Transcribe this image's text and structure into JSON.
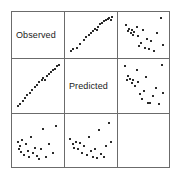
{
  "figure": {
    "type": "scatterplot-matrix",
    "width": 180,
    "height": 180,
    "background": "#ffffff",
    "frame_color": "#6b6b6b",
    "point_color": "#2b2b2b",
    "label_color": "#1a1a1a"
  },
  "variables": [
    {
      "key": "observed",
      "label": "Observed"
    },
    {
      "key": "predicted",
      "label": "Predicted"
    },
    {
      "key": "std_residuals",
      "label": "Std Residuals"
    }
  ],
  "chart_data": {
    "type": "scatter",
    "title": "",
    "xlabel": "",
    "ylabel": "",
    "grid": false,
    "legend": "none",
    "matrix": {
      "rows": [
        "Observed",
        "Predicted",
        "Std Residuals"
      ],
      "cols": [
        "Observed",
        "Predicted",
        "Std Residuals"
      ],
      "diagonal": "variable-label",
      "axis_ranges": {
        "x": [
          0,
          1
        ],
        "y": [
          0,
          1
        ]
      },
      "note": "Off-diagonal panels plot column variable on x and row variable on y; coordinates below are normalized 0-1 within each panel, y measured upward."
    },
    "panels": [
      {
        "row": 0,
        "col": 0,
        "kind": "diagonal",
        "label": "Observed",
        "points": []
      },
      {
        "row": 0,
        "col": 1,
        "kind": "scatter",
        "x_var": "Predicted",
        "y_var": "Observed",
        "relationship": "strong positive linear",
        "points": [
          [
            0.05,
            0.07
          ],
          [
            0.1,
            0.12
          ],
          [
            0.18,
            0.17
          ],
          [
            0.26,
            0.27
          ],
          [
            0.33,
            0.36
          ],
          [
            0.39,
            0.44
          ],
          [
            0.45,
            0.5
          ],
          [
            0.5,
            0.55
          ],
          [
            0.55,
            0.6
          ],
          [
            0.58,
            0.66
          ],
          [
            0.63,
            0.62
          ],
          [
            0.66,
            0.72
          ],
          [
            0.71,
            0.78
          ],
          [
            0.76,
            0.82
          ],
          [
            0.8,
            0.86
          ],
          [
            0.84,
            0.9
          ],
          [
            0.88,
            0.93
          ],
          [
            0.92,
            0.95
          ],
          [
            0.95,
            0.9
          ],
          [
            0.97,
            0.97
          ]
        ]
      },
      {
        "row": 0,
        "col": 2,
        "kind": "scatter",
        "x_var": "Std Residuals",
        "y_var": "Observed",
        "relationship": "no clear pattern",
        "points": [
          [
            0.09,
            0.76
          ],
          [
            0.13,
            0.6
          ],
          [
            0.16,
            0.66
          ],
          [
            0.2,
            0.55
          ],
          [
            0.22,
            0.63
          ],
          [
            0.24,
            0.5
          ],
          [
            0.28,
            0.58
          ],
          [
            0.33,
            0.7
          ],
          [
            0.36,
            0.47
          ],
          [
            0.38,
            0.2
          ],
          [
            0.44,
            0.3
          ],
          [
            0.48,
            0.62
          ],
          [
            0.52,
            0.15
          ],
          [
            0.56,
            0.4
          ],
          [
            0.61,
            0.12
          ],
          [
            0.66,
            0.35
          ],
          [
            0.72,
            0.08
          ],
          [
            0.79,
            0.55
          ],
          [
            0.88,
            0.94
          ],
          [
            0.93,
            0.24
          ]
        ]
      },
      {
        "row": 1,
        "col": 0,
        "kind": "scatter",
        "x_var": "Observed",
        "y_var": "Predicted",
        "relationship": "strong positive linear",
        "points": [
          [
            0.05,
            0.06
          ],
          [
            0.09,
            0.1
          ],
          [
            0.15,
            0.18
          ],
          [
            0.2,
            0.24
          ],
          [
            0.26,
            0.3
          ],
          [
            0.31,
            0.35
          ],
          [
            0.37,
            0.42
          ],
          [
            0.43,
            0.48
          ],
          [
            0.48,
            0.53
          ],
          [
            0.53,
            0.58
          ],
          [
            0.58,
            0.63
          ],
          [
            0.62,
            0.68
          ],
          [
            0.66,
            0.64
          ],
          [
            0.7,
            0.72
          ],
          [
            0.74,
            0.76
          ],
          [
            0.79,
            0.8
          ],
          [
            0.84,
            0.84
          ],
          [
            0.88,
            0.88
          ],
          [
            0.93,
            0.93
          ],
          [
            0.97,
            0.96
          ]
        ]
      },
      {
        "row": 1,
        "col": 1,
        "kind": "diagonal",
        "label": "Predicted",
        "points": []
      },
      {
        "row": 1,
        "col": 2,
        "kind": "scatter",
        "x_var": "Std Residuals",
        "y_var": "Predicted",
        "relationship": "no clear pattern",
        "points": [
          [
            0.06,
            0.93
          ],
          [
            0.11,
            0.62
          ],
          [
            0.14,
            0.72
          ],
          [
            0.18,
            0.66
          ],
          [
            0.22,
            0.56
          ],
          [
            0.26,
            0.64
          ],
          [
            0.29,
            0.5
          ],
          [
            0.33,
            0.84
          ],
          [
            0.37,
            0.58
          ],
          [
            0.4,
            0.33
          ],
          [
            0.45,
            0.22
          ],
          [
            0.5,
            0.4
          ],
          [
            0.55,
            0.7
          ],
          [
            0.58,
            0.14
          ],
          [
            0.64,
            0.12
          ],
          [
            0.7,
            0.28
          ],
          [
            0.77,
            0.46
          ],
          [
            0.84,
            0.11
          ],
          [
            0.9,
            0.96
          ],
          [
            0.94,
            0.35
          ]
        ]
      },
      {
        "row": 2,
        "col": 0,
        "kind": "scatter",
        "x_var": "Observed",
        "y_var": "Std Residuals",
        "relationship": "no clear pattern",
        "points": [
          [
            0.04,
            0.48
          ],
          [
            0.07,
            0.34
          ],
          [
            0.09,
            0.4
          ],
          [
            0.11,
            0.28
          ],
          [
            0.14,
            0.53
          ],
          [
            0.18,
            0.22
          ],
          [
            0.22,
            0.45
          ],
          [
            0.27,
            0.3
          ],
          [
            0.3,
            0.17
          ],
          [
            0.35,
            0.6
          ],
          [
            0.39,
            0.26
          ],
          [
            0.43,
            0.37
          ],
          [
            0.47,
            0.2
          ],
          [
            0.52,
            0.12
          ],
          [
            0.57,
            0.33
          ],
          [
            0.62,
            0.76
          ],
          [
            0.68,
            0.18
          ],
          [
            0.74,
            0.44
          ],
          [
            0.83,
            0.25
          ],
          [
            0.92,
            0.83
          ]
        ]
      },
      {
        "row": 2,
        "col": 1,
        "kind": "scatter",
        "x_var": "Predicted",
        "y_var": "Std Residuals",
        "relationship": "no clear pattern",
        "points": [
          [
            0.03,
            0.55
          ],
          [
            0.08,
            0.44
          ],
          [
            0.12,
            0.37
          ],
          [
            0.16,
            0.5
          ],
          [
            0.2,
            0.33
          ],
          [
            0.25,
            0.47
          ],
          [
            0.29,
            0.26
          ],
          [
            0.34,
            0.4
          ],
          [
            0.4,
            0.22
          ],
          [
            0.45,
            0.6
          ],
          [
            0.5,
            0.3
          ],
          [
            0.55,
            0.18
          ],
          [
            0.6,
            0.35
          ],
          [
            0.64,
            0.14
          ],
          [
            0.69,
            0.74
          ],
          [
            0.73,
            0.24
          ],
          [
            0.79,
            0.16
          ],
          [
            0.85,
            0.41
          ],
          [
            0.92,
            0.9
          ],
          [
            0.96,
            0.48
          ]
        ]
      }
    ]
  }
}
